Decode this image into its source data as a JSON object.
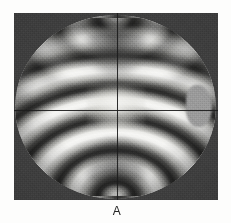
{
  "figure": {
    "caption_label": "A",
    "frame": {
      "left": 14,
      "top": 13,
      "width": 204,
      "height": 187,
      "background_color": "#3a3a3a"
    },
    "field_of_view": {
      "shape": "circle",
      "diameter": 201,
      "has_right_bulge": true,
      "bright_color": "#f4f4f2",
      "dark_color": "#2e2e2d"
    },
    "reticle": {
      "horizontal_line_y": 110,
      "vertical_line_x": 117,
      "color": "#1c1c1c"
    },
    "melatopes": [
      {
        "name": "upper-melatope",
        "x": 117,
        "y": 18
      },
      {
        "name": "lower-melatope",
        "x": 117,
        "y": 197
      }
    ]
  },
  "page": {
    "background_color": "#fdfdfc",
    "text_color": "#242424"
  }
}
